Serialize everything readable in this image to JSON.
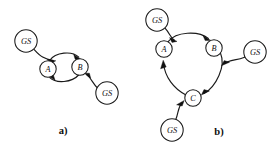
{
  "figure": {
    "background_color": "#ffffff",
    "stroke_color": "#1a1a1a",
    "panels": [
      {
        "id": "panel-a",
        "caption": "a)",
        "caption_x": 63,
        "caption_y": 130,
        "nodes": [
          {
            "id": "a-gs-left",
            "label": "GS",
            "kind": "gs",
            "cx": 26,
            "cy": 41,
            "r": 11.2
          },
          {
            "id": "a-state-a",
            "label": "A",
            "kind": "state",
            "cx": 48,
            "cy": 69,
            "r": 8.2
          },
          {
            "id": "a-state-b",
            "label": "B",
            "kind": "state",
            "cx": 80,
            "cy": 67,
            "r": 8.2
          },
          {
            "id": "a-gs-right",
            "label": "GS",
            "kind": "gs",
            "cx": 107,
            "cy": 93,
            "r": 11.2
          }
        ],
        "edges": [
          {
            "id": "a-edge-gsleft-to-a",
            "from": "a-gs-left",
            "to": "a-state-a",
            "type": "entry",
            "label": ""
          },
          {
            "id": "a-edge-a-to-b",
            "from": "a-state-a",
            "to": "a-state-b",
            "type": "arc-up",
            "label": ""
          },
          {
            "id": "a-edge-b-to-a",
            "from": "a-state-b",
            "to": "a-state-a",
            "type": "arc-dn",
            "label": ""
          },
          {
            "id": "a-edge-gsright-to-b",
            "from": "a-gs-right",
            "to": "a-state-b",
            "type": "entry",
            "label": ""
          }
        ]
      },
      {
        "id": "panel-b",
        "caption": "b)",
        "caption_x": 219,
        "caption_y": 131,
        "nodes": [
          {
            "id": "b-gs-top",
            "label": "GS",
            "kind": "gs",
            "cx": 157,
            "cy": 20,
            "r": 11.2
          },
          {
            "id": "b-state-a",
            "label": "A",
            "kind": "state",
            "cx": 164,
            "cy": 49,
            "r": 8.2
          },
          {
            "id": "b-state-b",
            "label": "B",
            "kind": "state",
            "cx": 214,
            "cy": 48,
            "r": 8.2
          },
          {
            "id": "b-gs-right",
            "label": "GS",
            "kind": "gs",
            "cx": 255,
            "cy": 52,
            "r": 11.2
          },
          {
            "id": "b-state-c",
            "label": "C",
            "kind": "state",
            "cx": 193,
            "cy": 98,
            "r": 8.2
          },
          {
            "id": "b-gs-bottom",
            "label": "GS",
            "kind": "gs",
            "cx": 172,
            "cy": 130,
            "r": 11.2
          }
        ],
        "edges": [
          {
            "id": "b-edge-gstop-to-a",
            "from": "b-gs-top",
            "to": "b-state-a",
            "type": "entry",
            "label": ""
          },
          {
            "id": "b-edge-a-to-b",
            "from": "b-state-a",
            "to": "b-state-b",
            "type": "arc",
            "label": ""
          },
          {
            "id": "b-edge-b-to-c",
            "from": "b-state-b",
            "to": "b-state-c",
            "type": "arc",
            "label": ""
          },
          {
            "id": "b-edge-c-to-a",
            "from": "b-state-c",
            "to": "b-state-a",
            "type": "arc",
            "label": ""
          },
          {
            "id": "b-edge-gsright-to-b",
            "from": "b-gs-right",
            "to": "b-state-b",
            "type": "entry",
            "label": ""
          },
          {
            "id": "b-edge-gsbottom-to-c",
            "from": "b-gs-bottom",
            "to": "b-state-c",
            "type": "entry",
            "label": ""
          }
        ]
      }
    ]
  }
}
